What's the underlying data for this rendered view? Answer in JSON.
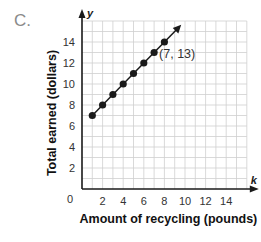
{
  "option_label": "C.",
  "chart_data": {
    "type": "line",
    "title": "",
    "xlabel": "Amount of recycling (pounds)",
    "ylabel": "Total earned (dollars)",
    "x_axis_var": "k",
    "y_axis_var": "y",
    "xlim": [
      0,
      16
    ],
    "ylim": [
      0,
      16
    ],
    "x_ticks": [
      2,
      4,
      6,
      8,
      10,
      12,
      14
    ],
    "y_ticks": [
      2,
      4,
      6,
      8,
      10,
      12,
      14
    ],
    "origin_label": "0",
    "grid": true,
    "series": [
      {
        "name": "earnings",
        "x": [
          1,
          2,
          3,
          4,
          5,
          6,
          7,
          8
        ],
        "values": [
          7,
          8,
          9,
          10,
          11,
          12,
          13,
          14
        ],
        "marker": "dot",
        "line_extends_with_arrow": true
      }
    ],
    "annotations": [
      {
        "text": "(7, 13)",
        "x": 7,
        "y": 13
      }
    ],
    "colors": {
      "line": "#1a1a1a",
      "grid": "#cfcfcf",
      "axis": "#1a1a1a",
      "text": "#333333"
    }
  }
}
